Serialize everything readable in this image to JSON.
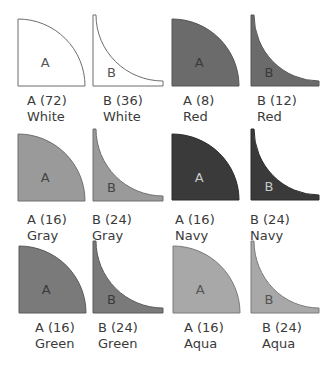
{
  "note": "Fill colors are approximate grays read from a low-fidelity screenshot; names like Red/Navy/Green/Aqua render as grays here and may not reflect intended hues.",
  "tiles": [
    {
      "type": "A",
      "count_label": "A (72)",
      "color_name": "White",
      "fill": "#ffffff",
      "stroke": "#6d6d6d",
      "letter_color": "#555555",
      "x": 17,
      "y": 18,
      "w": 67,
      "h": 67,
      "cap_x": 27,
      "cap_y": 93
    },
    {
      "type": "B",
      "count_label": "B (36)",
      "color_name": "White",
      "fill": "#ffffff",
      "stroke": "#6d6d6d",
      "letter_color": "#555555",
      "x": 92,
      "y": 14,
      "w": 70,
      "h": 71,
      "cap_x": 103,
      "cap_y": 93
    },
    {
      "type": "A",
      "count_label": "A (8)",
      "color_name": "Red",
      "fill": "#6b6b6b",
      "stroke": "#555555",
      "letter_color": "#3a3a3a",
      "x": 171,
      "y": 18,
      "w": 67,
      "h": 67,
      "cap_x": 183,
      "cap_y": 93
    },
    {
      "type": "B",
      "count_label": "B (12)",
      "color_name": "Red",
      "fill": "#6b6b6b",
      "stroke": "#555555",
      "letter_color": "#3a3a3a",
      "x": 250,
      "y": 14,
      "w": 68,
      "h": 71,
      "cap_x": 257,
      "cap_y": 93
    },
    {
      "type": "A",
      "count_label": "A (16)",
      "color_name": "Gray",
      "fill": "#9a9a9a",
      "stroke": "#6f6f6f",
      "letter_color": "#444444",
      "x": 17,
      "y": 133,
      "w": 67,
      "h": 67,
      "cap_x": 27,
      "cap_y": 212
    },
    {
      "type": "B",
      "count_label": "B (24)",
      "color_name": "Gray",
      "fill": "#9a9a9a",
      "stroke": "#6f6f6f",
      "letter_color": "#444444",
      "x": 92,
      "y": 128,
      "w": 70,
      "h": 72,
      "cap_x": 92,
      "cap_y": 212
    },
    {
      "type": "A",
      "count_label": "A (16)",
      "color_name": "Navy",
      "fill": "#3a3a3a",
      "stroke": "#2a2a2a",
      "letter_color": "#c8c8c8",
      "x": 171,
      "y": 133,
      "w": 67,
      "h": 66,
      "cap_x": 175,
      "cap_y": 212
    },
    {
      "type": "B",
      "count_label": "B (24)",
      "color_name": "Navy",
      "fill": "#3a3a3a",
      "stroke": "#2a2a2a",
      "letter_color": "#c8c8c8",
      "x": 250,
      "y": 128,
      "w": 68,
      "h": 71,
      "cap_x": 250,
      "cap_y": 212
    },
    {
      "type": "A",
      "count_label": "A (16)",
      "color_name": "Green",
      "fill": "#7a7a7a",
      "stroke": "#5a5a5a",
      "letter_color": "#3a3a3a",
      "x": 18,
      "y": 245,
      "w": 67,
      "h": 67,
      "cap_x": 35,
      "cap_y": 320
    },
    {
      "type": "B",
      "count_label": "B (24)",
      "color_name": "Green",
      "fill": "#7a7a7a",
      "stroke": "#5a5a5a",
      "letter_color": "#3a3a3a",
      "x": 92,
      "y": 240,
      "w": 70,
      "h": 72,
      "cap_x": 98,
      "cap_y": 320
    },
    {
      "type": "A",
      "count_label": "A (16)",
      "color_name": "Aqua",
      "fill": "#a8a8a8",
      "stroke": "#7a7a7a",
      "letter_color": "#555555",
      "x": 172,
      "y": 245,
      "w": 67,
      "h": 67,
      "cap_x": 184,
      "cap_y": 320
    },
    {
      "type": "B",
      "count_label": "B (24)",
      "color_name": "Aqua",
      "fill": "#a8a8a8",
      "stroke": "#7a7a7a",
      "letter_color": "#555555",
      "x": 250,
      "y": 240,
      "w": 68,
      "h": 72,
      "cap_x": 262,
      "cap_y": 320
    }
  ]
}
